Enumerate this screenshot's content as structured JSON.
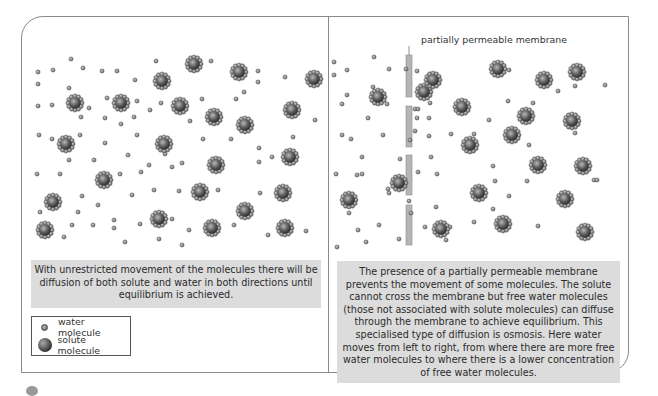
{
  "diagram": {
    "left_panel": {
      "caption": "With unrestricted movement of the molecules there will be diffusion of both solute and water in both directions until equilibrium is achieved.",
      "solute_count": 30,
      "water_count": 80
    },
    "right_panel": {
      "membrane_label": "partially permeable membrane",
      "caption": "The presence of a partially permeable membrane prevents the movement of some molecules. The solute cannot cross the membrane but free water molecules (those not associated with solute molecules) can diffuse through the membrane  to achieve equilibrium. This specialised type of diffusion is osmosis. Here water moves from left to right, from where there are more free water molecules to where there is a lower concentration of free water molecules.",
      "left_side_solute_count": 5,
      "right_side_solute_count": 17
    },
    "legend": {
      "items": [
        {
          "icon": "water-molecule-icon",
          "label": "water molecule"
        },
        {
          "icon": "solute-molecule-icon",
          "label": "solute molecule"
        }
      ]
    },
    "colors": {
      "caption_bg": "#dcdcdc",
      "frame": "#8a8a8a",
      "membrane": "#b5b5b5",
      "solute": "#555555",
      "water": "#888888"
    }
  }
}
